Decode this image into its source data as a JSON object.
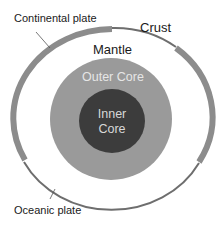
{
  "diagram": {
    "labels": {
      "continental_plate": "Continental plate",
      "oceanic_plate": "Oceanic plate",
      "crust": "Crust",
      "mantle": "Mantle",
      "outer_core": "Outer Core",
      "inner_core_line1": "Inner",
      "inner_core_line2": "Core"
    },
    "colors": {
      "background": "#ffffff",
      "continental_crust": "#8c8c8c",
      "oceanic_crust": "#7a7a7a",
      "mantle": "#ffffff",
      "outer_core": "#9a9a9a",
      "inner_core": "#3c3c3c",
      "leader_line": "#555555",
      "text": "#1a1a1a"
    },
    "layers": [
      {
        "name": "Crust",
        "shape": "ring",
        "segments": [
          "continental (thick)",
          "oceanic (thin)"
        ]
      },
      {
        "name": "Mantle",
        "shape": "white ring"
      },
      {
        "name": "Outer Core",
        "shape": "gray disc"
      },
      {
        "name": "Inner Core",
        "shape": "dark disc"
      }
    ]
  }
}
